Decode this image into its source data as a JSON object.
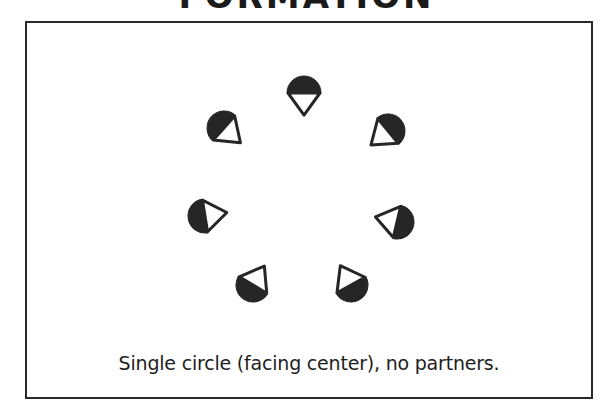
{
  "header": {
    "title": "FORMATION"
  },
  "diagram": {
    "formation_center": {
      "x": 304,
      "y": 200
    },
    "dancer_style": {
      "back_fill": "#262626",
      "outline": "#262626",
      "front_fill": "#ffffff",
      "radius": 17
    },
    "dancers": [
      {
        "id": "dancer-1",
        "position": "top",
        "x": 304,
        "y": 93,
        "facing": "center"
      },
      {
        "id": "dancer-2",
        "position": "upper-right",
        "x": 388,
        "y": 131,
        "facing": "center"
      },
      {
        "id": "dancer-3",
        "position": "middle-right",
        "x": 397,
        "y": 222,
        "facing": "center"
      },
      {
        "id": "dancer-4",
        "position": "lower-right",
        "x": 351,
        "y": 285,
        "facing": "center"
      },
      {
        "id": "dancer-5",
        "position": "lower-left",
        "x": 253,
        "y": 285,
        "facing": "center"
      },
      {
        "id": "dancer-6",
        "position": "middle-left",
        "x": 205,
        "y": 216,
        "facing": "center"
      },
      {
        "id": "dancer-7",
        "position": "upper-left",
        "x": 224,
        "y": 128,
        "facing": "center"
      }
    ],
    "caption": "Single circle (facing center), no partners."
  }
}
